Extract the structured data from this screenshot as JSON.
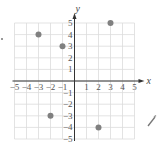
{
  "chart_data": {
    "type": "scatter",
    "title": "",
    "xlabel": "x",
    "ylabel": "y",
    "xlim": [
      -5,
      5
    ],
    "ylim": [
      -5,
      5
    ],
    "grid": true,
    "xticks": [
      -5,
      -4,
      -3,
      -2,
      -1,
      1,
      2,
      3,
      4,
      5
    ],
    "yticks": [
      -5,
      -4,
      -3,
      -2,
      -1,
      1,
      2,
      3,
      4,
      5
    ],
    "x_tick_labels": [
      "−5",
      "−4",
      "−3",
      "−2",
      "−1",
      "1",
      "2",
      "3",
      "4",
      "5"
    ],
    "y_tick_labels": [
      "−5",
      "−4",
      "−3",
      "−2",
      "−1",
      "1",
      "2",
      "3",
      "4",
      "5"
    ],
    "points": [
      {
        "x": -3,
        "y": 4
      },
      {
        "x": -1,
        "y": 3
      },
      {
        "x": 3,
        "y": 5
      },
      {
        "x": -2,
        "y": -3
      },
      {
        "x": 2,
        "y": -4
      }
    ],
    "colors": {
      "point": "#808080",
      "grid": "#dcdcdc",
      "axis": "#333333"
    }
  },
  "layout": {
    "origin_px": [
      74.5,
      81
    ],
    "unit_px": [
      12,
      11.6
    ]
  },
  "icons": {
    "pencil": "pencil-icon"
  }
}
